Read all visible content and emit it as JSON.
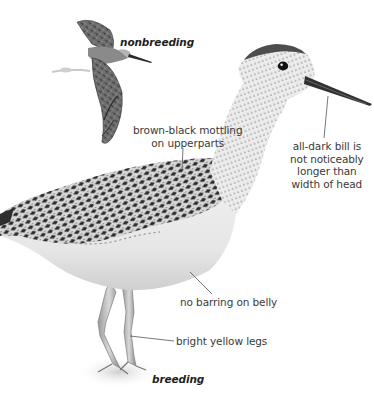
{
  "figure": {
    "background": "#ffffff",
    "ink_color": "#2b2b2b",
    "leader_line_color": "#555555"
  },
  "plumage_labels": {
    "nonbreeding": "nonbreeding",
    "breeding": "breeding"
  },
  "callouts": [
    {
      "id": "upperparts",
      "lines": [
        "brown-black mottling",
        "on upperparts"
      ]
    },
    {
      "id": "bill",
      "lines": [
        "all-dark bill is",
        "not noticeably",
        "longer than",
        "width of head"
      ]
    },
    {
      "id": "belly",
      "lines": [
        "no barring on belly"
      ]
    },
    {
      "id": "legs",
      "lines": [
        "bright yellow legs"
      ]
    }
  ]
}
